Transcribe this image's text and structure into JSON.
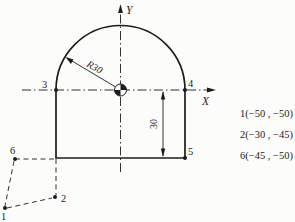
{
  "figure": {
    "background": "#fcfcfa",
    "line_color": "#1c1c1c",
    "axes": {
      "x_label": "X",
      "y_label": "Y"
    },
    "dimensions": {
      "radius_label": "R30",
      "height_label": "30"
    },
    "point_labels": {
      "p1": "1",
      "p2": "2",
      "p3": "3",
      "p4": "4",
      "p5": "5",
      "p6": "6"
    },
    "coordinate_list": [
      "1(−50 , −50)",
      "2(−30 , −45)",
      "6(−45 , −50)"
    ]
  }
}
